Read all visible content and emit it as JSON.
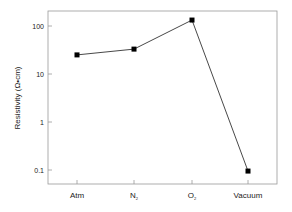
{
  "chart_data": {
    "type": "line",
    "title": "",
    "xlabel": "",
    "ylabel": "Resistivity (Ω•cm)",
    "yscale": "log",
    "ylim": [
      0.06,
      200
    ],
    "yticks": [
      100,
      10,
      1,
      0.1
    ],
    "ytick_labels": [
      "100",
      "10",
      "1",
      "0.1"
    ],
    "categories": [
      "Atm",
      "N2",
      "O2",
      "Vacuum"
    ],
    "category_display": [
      {
        "main": "Atm",
        "sub": ""
      },
      {
        "main": "N",
        "sub": "2"
      },
      {
        "main": "O",
        "sub": "2"
      },
      {
        "main": "Vacuum",
        "sub": ""
      }
    ],
    "series": [
      {
        "name": "Resistivity",
        "values": [
          25,
          33,
          133,
          0.095
        ],
        "marker": "square",
        "color": "#000000"
      }
    ],
    "grid": false,
    "legend": null
  },
  "colors": {
    "line": "#333333",
    "marker": "#000000",
    "frame": "#999999"
  }
}
